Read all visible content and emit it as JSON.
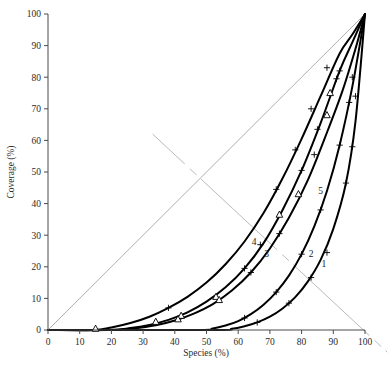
{
  "chart_data": {
    "type": "line",
    "title": "",
    "xlabel": "Species (%)",
    "ylabel": "Coverage (%)",
    "xlim": [
      0,
      100
    ],
    "ylim": [
      0,
      100
    ],
    "xticks": [
      0,
      10,
      20,
      30,
      40,
      50,
      60,
      70,
      80,
      90,
      100
    ],
    "yticks": [
      0,
      10,
      20,
      30,
      40,
      50,
      60,
      70,
      80,
      90,
      100
    ],
    "xtick_labels": [
      "0",
      "10",
      "20",
      "30",
      "40",
      "50",
      "60",
      "70",
      "80",
      "90",
      "100"
    ],
    "ytick_labels": [
      "0",
      "10",
      "20",
      "30",
      "40",
      "50",
      "60",
      "70",
      "80",
      "90",
      "100"
    ],
    "grid": false,
    "legend": "inline-curve-labels",
    "marker_types": [
      "plus",
      "triangle"
    ],
    "reference_lines": [
      {
        "name": "diagonal-1to1",
        "from": [
          0,
          0
        ],
        "to": [
          100,
          100
        ],
        "style": "thin-grey"
      },
      {
        "name": "anti-diagonal",
        "from": [
          33,
          62
        ],
        "to": [
          107,
          -7
        ],
        "style": "thin-grey-dashed-gap"
      }
    ],
    "series": [
      {
        "name": "1",
        "label": "1",
        "label_at": [
          87,
          20
        ],
        "x": [
          0,
          52,
          58,
          62,
          66,
          70,
          74,
          78,
          82,
          86,
          90,
          94,
          97,
          100
        ],
        "y": [
          0,
          0,
          0.4,
          1.2,
          2.4,
          4.2,
          6.8,
          10.4,
          15.4,
          22.2,
          32.0,
          46.5,
          66.0,
          100
        ],
        "markers": [
          {
            "type": "plus",
            "x": 66,
            "y": 2.4
          },
          {
            "type": "plus",
            "x": 76,
            "y": 8.5
          },
          {
            "type": "plus",
            "x": 83,
            "y": 16.6
          },
          {
            "type": "plus",
            "x": 88,
            "y": 24.5
          },
          {
            "type": "plus",
            "x": 94,
            "y": 46.5
          },
          {
            "type": "plus",
            "x": 96,
            "y": 58.0
          },
          {
            "type": "plus",
            "x": 97,
            "y": 74.0
          }
        ]
      },
      {
        "name": "2",
        "label": "2",
        "label_at": [
          83,
          23
        ],
        "x": [
          0,
          46,
          52,
          56,
          60,
          64,
          68,
          72,
          76,
          80,
          84,
          88,
          92,
          96,
          100
        ],
        "y": [
          0,
          0,
          0.5,
          1.4,
          2.8,
          5.0,
          8.0,
          12.0,
          17.2,
          24.0,
          32.8,
          44.0,
          58.5,
          77.0,
          100
        ],
        "markers": [
          {
            "type": "plus",
            "x": 62,
            "y": 3.8
          },
          {
            "type": "plus",
            "x": 72,
            "y": 12.0
          },
          {
            "type": "plus",
            "x": 80,
            "y": 24.0
          },
          {
            "type": "plus",
            "x": 86,
            "y": 38.0
          },
          {
            "type": "plus",
            "x": 92,
            "y": 58.5
          },
          {
            "type": "plus",
            "x": 95,
            "y": 72.0
          },
          {
            "type": "plus",
            "x": 96,
            "y": 80.0
          }
        ]
      },
      {
        "name": "3",
        "label": "3",
        "label_at": [
          69,
          23
        ],
        "x": [
          0,
          19,
          26,
          32,
          38,
          44,
          50,
          56,
          62,
          68,
          74,
          80,
          86,
          92,
          96,
          100
        ],
        "y": [
          0,
          0,
          0.6,
          1.6,
          3.2,
          5.6,
          9.0,
          13.5,
          19.5,
          27.5,
          38.0,
          50.5,
          65.5,
          82.0,
          91.0,
          100
        ],
        "markers": [
          {
            "type": "triangle",
            "x": 42,
            "y": 4.5
          },
          {
            "type": "triangle",
            "x": 53,
            "y": 10.5
          },
          {
            "type": "plus",
            "x": 62,
            "y": 19.5
          },
          {
            "type": "triangle",
            "x": 73,
            "y": 36.5
          },
          {
            "type": "plus",
            "x": 80,
            "y": 50.5
          },
          {
            "type": "plus",
            "x": 85,
            "y": 63.5
          },
          {
            "type": "triangle",
            "x": 89,
            "y": 75.0
          },
          {
            "type": "plus",
            "x": 92,
            "y": 82.0
          }
        ]
      },
      {
        "name": "4",
        "label": "4",
        "label_at": [
          65,
          27
        ],
        "x": [
          0,
          14,
          20,
          26,
          32,
          38,
          44,
          50,
          56,
          62,
          68,
          74,
          80,
          86,
          92,
          96,
          100
        ],
        "y": [
          0,
          0,
          0.8,
          2.2,
          4.2,
          7.0,
          10.5,
          15.0,
          20.8,
          28.0,
          37.0,
          48.0,
          60.5,
          74.0,
          87.5,
          93.5,
          100
        ],
        "markers": [
          {
            "type": "triangle",
            "x": 15,
            "y": 0.4
          },
          {
            "type": "triangle",
            "x": 34,
            "y": 2.6
          },
          {
            "type": "plus",
            "x": 38,
            "y": 7.0
          },
          {
            "type": "plus",
            "x": 67,
            "y": 27.0
          },
          {
            "type": "plus",
            "x": 72,
            "y": 44.5
          },
          {
            "type": "plus",
            "x": 78,
            "y": 57.0
          },
          {
            "type": "plus",
            "x": 83,
            "y": 70.0
          },
          {
            "type": "plus",
            "x": 88,
            "y": 83.0
          }
        ]
      },
      {
        "name": "5",
        "label": "5",
        "label_at": [
          86,
          43
        ],
        "x": [
          0,
          20,
          27,
          34,
          40,
          46,
          52,
          58,
          64,
          70,
          76,
          82,
          88,
          93,
          97,
          100
        ],
        "y": [
          0,
          0,
          0.5,
          1.5,
          3.0,
          5.2,
          8.2,
          12.5,
          18.2,
          25.8,
          35.5,
          47.5,
          62.5,
          76.0,
          89.0,
          100
        ],
        "markers": [
          {
            "type": "triangle",
            "x": 41,
            "y": 3.4
          },
          {
            "type": "triangle",
            "x": 54,
            "y": 9.5
          },
          {
            "type": "plus",
            "x": 64,
            "y": 18.2
          },
          {
            "type": "plus",
            "x": 73,
            "y": 30.5
          },
          {
            "type": "triangle",
            "x": 79,
            "y": 43.0
          },
          {
            "type": "plus",
            "x": 84,
            "y": 55.5
          },
          {
            "type": "triangle",
            "x": 88,
            "y": 68.0
          },
          {
            "type": "plus",
            "x": 91,
            "y": 79.5
          }
        ]
      }
    ]
  },
  "axes": {
    "xlabel": "Species (%)",
    "ylabel": "Coverage (%)"
  }
}
